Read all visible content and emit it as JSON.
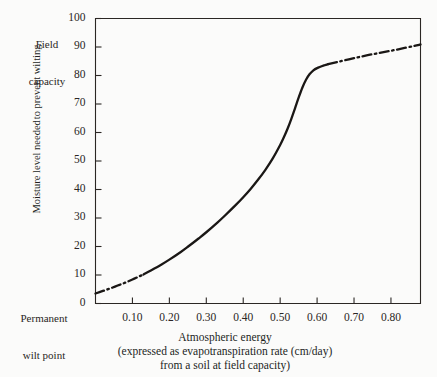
{
  "figure": {
    "background_color": "#fbfbfa",
    "ink_color": "#231f1d"
  },
  "annotations": {
    "field_capacity_line1": "Field",
    "field_capacity_line2": "capacity",
    "wilt_point_line1": "Permanent",
    "wilt_point_line2": "wilt point"
  },
  "y_axis": {
    "title_line1": "Moisture level needed",
    "title_line2": "to prevent wilting"
  },
  "x_axis": {
    "caption_line1": "Atmospheric energy",
    "caption_line2": "(expressed as evapotranspiration rate (cm/day)",
    "caption_line3": "from a soil at field capacity)"
  },
  "chart_data": {
    "type": "line",
    "title": "",
    "xlabel": "Atmospheric energy (expressed as evapotranspiration rate (cm/day) from a soil at field capacity)",
    "ylabel": "Moisture level needed to prevent wilting",
    "xlim": [
      0.0,
      0.88
    ],
    "ylim": [
      0,
      100
    ],
    "grid": false,
    "legend": null,
    "xticks": [
      0.1,
      0.2,
      0.3,
      0.4,
      0.5,
      0.6,
      0.7,
      0.8
    ],
    "xtick_labels": [
      "0.10",
      "0.20",
      "0.30",
      "0.40",
      "0.50",
      "0.60",
      "0.70",
      "0.80"
    ],
    "yticks": [
      0,
      10,
      20,
      30,
      40,
      50,
      60,
      70,
      80,
      90,
      100
    ],
    "ytick_labels": [
      "0",
      "10",
      "20",
      "30",
      "40",
      "50",
      "60",
      "70",
      "80",
      "90",
      "100"
    ],
    "y_axis_endpoint_labels": {
      "top": "Field capacity",
      "bottom": "Permanent wilt point"
    },
    "series": [
      {
        "name": "Moisture level needed to prevent wilting",
        "linestyle": "mixed: dash-dot (extrapolated) / solid (measured)",
        "solid_range_x": [
          0.13,
          0.63
        ],
        "x": [
          0.0,
          0.02,
          0.04,
          0.06,
          0.08,
          0.1,
          0.12,
          0.13,
          0.15,
          0.18,
          0.2,
          0.23,
          0.25,
          0.28,
          0.3,
          0.33,
          0.35,
          0.38,
          0.4,
          0.42,
          0.44,
          0.46,
          0.48,
          0.5,
          0.51,
          0.52,
          0.53,
          0.54,
          0.55,
          0.56,
          0.57,
          0.58,
          0.59,
          0.6,
          0.62,
          0.63,
          0.66,
          0.7,
          0.74,
          0.78,
          0.82,
          0.86,
          0.88
        ],
        "y": [
          3.5,
          4.4,
          5.3,
          6.3,
          7.3,
          8.4,
          9.6,
          10.2,
          11.6,
          13.8,
          15.4,
          18.0,
          19.9,
          22.9,
          25.0,
          28.4,
          30.8,
          34.6,
          37.3,
          40.2,
          43.4,
          46.9,
          50.9,
          55.6,
          58.3,
          61.3,
          64.7,
          68.4,
          72.2,
          75.7,
          78.5,
          80.5,
          81.8,
          82.6,
          83.6,
          84.0,
          84.9,
          86.1,
          87.2,
          88.2,
          89.2,
          90.3,
          90.9
        ]
      }
    ]
  }
}
